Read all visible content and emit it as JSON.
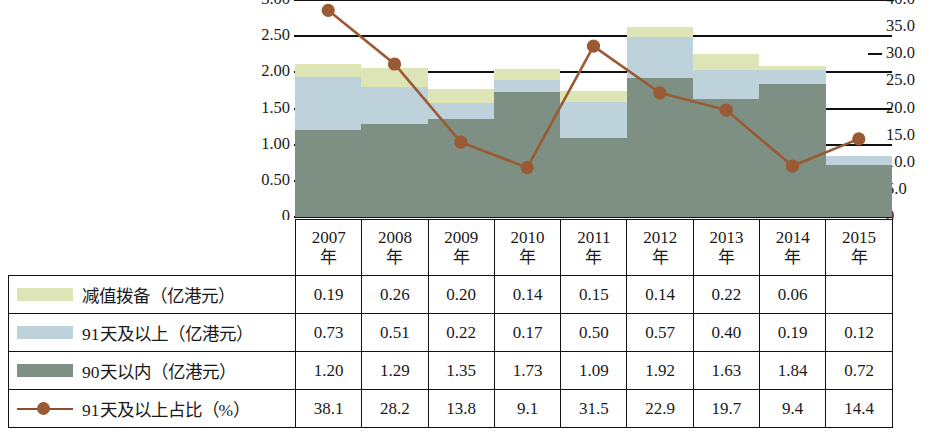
{
  "chart_data": {
    "type": "bar",
    "title": "",
    "subtitle": "",
    "xlabel": "",
    "ylabel": "",
    "y2label": "",
    "grid": true,
    "legend_position": "table-left-column",
    "categories": [
      "2007\n年",
      "2008\n年",
      "2009\n年",
      "2010\n年",
      "2011\n年",
      "2012\n年",
      "2013\n年",
      "2014\n年",
      "2015\n年"
    ],
    "category_labels_line1": [
      "2007",
      "2008",
      "2009",
      "2010",
      "2011",
      "2012",
      "2013",
      "2014",
      "2015"
    ],
    "category_labels_line2": [
      "年",
      "年",
      "年",
      "年",
      "年",
      "年",
      "年",
      "年",
      "年"
    ],
    "ylim": [
      0,
      3.0
    ],
    "y2lim": [
      0,
      40.0
    ],
    "yticks": [
      "3.00",
      "2.50",
      "2.00",
      "1.50",
      "1.00",
      "0.50",
      "0"
    ],
    "ytick_values": [
      3.0,
      2.5,
      2.0,
      1.5,
      1.0,
      0.5,
      0
    ],
    "y2ticks": [
      "40.0",
      "35.0",
      "30.0",
      "25.0",
      "20.0",
      "15.0",
      "10.0",
      "5.0",
      "0"
    ],
    "y2tick_values": [
      40.0,
      35.0,
      30.0,
      25.0,
      20.0,
      15.0,
      10.0,
      5.0,
      0
    ],
    "stacked": true,
    "stack_order_bottom_to_top": [
      "90天以内（亿港元）",
      "91天及以上（亿港元）",
      "减值拨备（亿港元）"
    ],
    "series": [
      {
        "name": "减值拨备（亿港元）",
        "kind": "bar",
        "color": "#dde4b6",
        "axis": "left",
        "values": [
          0.19,
          0.26,
          0.2,
          0.14,
          0.15,
          0.14,
          0.22,
          0.06,
          null
        ],
        "display": [
          "0.19",
          "0.26",
          "0.20",
          "0.14",
          "0.15",
          "0.14",
          "0.22",
          "0.06",
          ""
        ]
      },
      {
        "name": "91天及以上（亿港元）",
        "kind": "bar",
        "color": "#bed2dc",
        "axis": "left",
        "values": [
          0.73,
          0.51,
          0.22,
          0.17,
          0.5,
          0.57,
          0.4,
          0.19,
          0.12
        ],
        "display": [
          "0.73",
          "0.51",
          "0.22",
          "0.17",
          "0.50",
          "0.57",
          "0.40",
          "0.19",
          "0.12"
        ]
      },
      {
        "name": "90天以内（亿港元）",
        "kind": "bar",
        "color": "#7d9083",
        "axis": "left",
        "values": [
          1.2,
          1.29,
          1.35,
          1.73,
          1.09,
          1.92,
          1.63,
          1.84,
          0.72
        ],
        "display": [
          "1.20",
          "1.29",
          "1.35",
          "1.73",
          "1.09",
          "1.92",
          "1.63",
          "1.84",
          "0.72"
        ]
      },
      {
        "name": "91天及以上占比（%）",
        "kind": "line",
        "color": "#9a5a33",
        "axis": "right",
        "values": [
          38.1,
          28.2,
          13.8,
          9.1,
          31.5,
          22.9,
          19.7,
          9.4,
          14.4
        ],
        "display": [
          "38.1",
          "28.2",
          "13.8",
          "9.1",
          "31.5",
          "22.9",
          "19.7",
          "9.4",
          "14.4"
        ]
      }
    ]
  },
  "table": {
    "rows": [
      {
        "legend_type": "swatch",
        "swatch_class": "swatch-impair",
        "label": "减值拨备（亿港元）",
        "series_index": 0
      },
      {
        "legend_type": "swatch",
        "swatch_class": "swatch-over91",
        "label": "91天及以上（亿港元）",
        "series_index": 1
      },
      {
        "legend_type": "swatch",
        "swatch_class": "swatch-under90",
        "label": "90天以内（亿港元）",
        "series_index": 2
      },
      {
        "legend_type": "line",
        "swatch_class": "swatch-line",
        "label": "91天及以上占比（%）",
        "series_index": 3
      }
    ]
  },
  "colors": {
    "impairment": "#dde4b6",
    "over_91_days": "#bed2dc",
    "within_90_days": "#7d9083",
    "ratio_line": "#9a5a33",
    "axis": "#111111",
    "background": "#ffffff"
  }
}
